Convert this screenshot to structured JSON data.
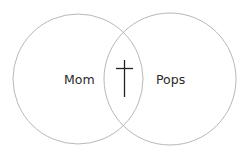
{
  "diagram": {
    "type": "venn",
    "sets": [
      {
        "label": "Mom"
      },
      {
        "label": "Pops"
      }
    ],
    "intersection": {
      "symbol": "cross-icon"
    },
    "colors": {
      "circle_stroke": "#b8b8b8",
      "cross": "#222222",
      "text": "#2a2a2a"
    }
  }
}
